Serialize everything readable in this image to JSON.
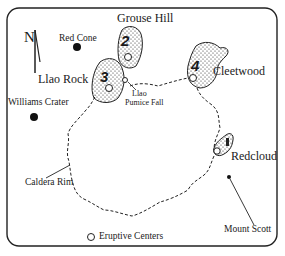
{
  "map": {
    "north_label": "N",
    "places": {
      "grouse_hill": "Grouse Hill",
      "red_cone": "Red Cone",
      "llao_rock": "Llao Rock",
      "williams_crater": "Williams Crater",
      "llao_pumice_fall_1": "Llao",
      "llao_pumice_fall_2": "Pumice Fall",
      "cleetwood": "Cleetwood",
      "redcloud": "Redcloud",
      "caldera_rim": "Caldera Rim",
      "mount_scott": "Mount Scott"
    },
    "domes": [
      {
        "id": "1",
        "name": "Redcloud"
      },
      {
        "id": "2",
        "name": "Grouse Hill"
      },
      {
        "id": "3",
        "name": "Llao Rock"
      },
      {
        "id": "4",
        "name": "Cleetwood"
      }
    ],
    "legend": {
      "eruptive_centers": "Eruptive Centers"
    },
    "colors": {
      "ink": "#1a1a1a",
      "background": "#ffffff"
    }
  }
}
